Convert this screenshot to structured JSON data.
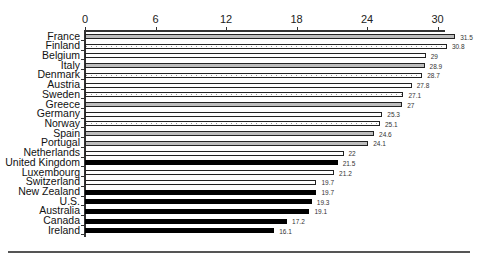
{
  "chart_data": {
    "type": "bar",
    "orientation": "horizontal",
    "title": "",
    "xlabel": "",
    "ylabel": "",
    "xlim": [
      0,
      30.7
    ],
    "x_ticks": [
      "0",
      "6",
      "12",
      "18",
      "24",
      "30"
    ],
    "x_tick_values": [
      0,
      6,
      12,
      18,
      24,
      30
    ],
    "grid": false,
    "legend": null,
    "categories": [
      "France",
      "Finland",
      "Belgium",
      "Italy",
      "Denmark",
      "Austria",
      "Sweden",
      "Greece",
      "Germany",
      "Norway",
      "Spain",
      "Portugal",
      "Netherlands",
      "United Kingdom",
      "Luxembourg",
      "Switzerland",
      "New Zealand",
      "U.S.",
      "Australia",
      "Canada",
      "Ireland"
    ],
    "values": [
      31.5,
      30.8,
      29,
      28.9,
      28.7,
      27.8,
      27.1,
      27,
      25.3,
      25.1,
      24.6,
      24.1,
      22,
      21.5,
      21.2,
      19.7,
      19.7,
      19.3,
      19.1,
      17.2,
      16.1
    ],
    "value_labels": [
      "31.5",
      "30.8",
      "29",
      "28.9",
      "28.7",
      "27.8",
      "27.1",
      "27",
      "25.3",
      "25.1",
      "24.6",
      "24.1",
      "22",
      "21.5",
      "21.2",
      "19.7",
      "19.7",
      "19.3",
      "19.1",
      "17.2",
      "16.1"
    ],
    "bar_styles": [
      "gray",
      "dotted",
      "white",
      "gray",
      "dotted",
      "white",
      "dotted",
      "gray",
      "white",
      "dotted",
      "gray",
      "gray",
      "white",
      "black",
      "white",
      "white",
      "black",
      "black",
      "black",
      "black",
      "black"
    ],
    "colors": {
      "gray": "#bdbdbd",
      "white": "#ffffff",
      "black": "#000000",
      "border": "#222222"
    }
  }
}
